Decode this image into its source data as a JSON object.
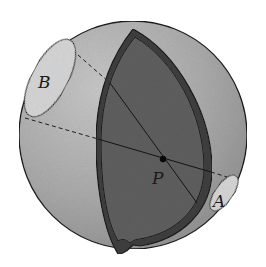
{
  "diagram": {
    "type": "sphere-cutaway",
    "labels": {
      "point_p": "P",
      "cap_a": "A",
      "cap_b": "B"
    },
    "colors": {
      "sphere_fill": "#a9a9a9",
      "sphere_highlight": "#c4c4c4",
      "inner_face": "#5e5e5e",
      "shell_rim": "#3c3c3c",
      "cap_fill": "#d4d4d4",
      "outline": "#1e1e1e",
      "background": "#ffffff"
    }
  }
}
